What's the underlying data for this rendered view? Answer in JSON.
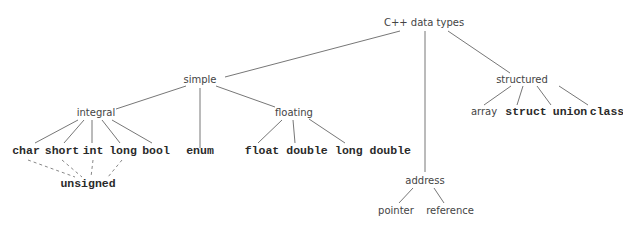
{
  "diagram": {
    "root": "C++ data types",
    "nodes": {
      "root": {
        "label": "C++ data types"
      },
      "simple": {
        "label": "simple"
      },
      "structured": {
        "label": "structured"
      },
      "address": {
        "label": "address"
      },
      "integral": {
        "label": "integral"
      },
      "enum": {
        "label": "enum"
      },
      "floating": {
        "label": "floating"
      },
      "char": {
        "label": "char"
      },
      "short": {
        "label": "short"
      },
      "int": {
        "label": "int"
      },
      "long": {
        "label": "long"
      },
      "bool": {
        "label": "bool"
      },
      "unsigned": {
        "label": "unsigned"
      },
      "float": {
        "label": "float"
      },
      "double": {
        "label": "double"
      },
      "long_double": {
        "label": "long double"
      },
      "array": {
        "label": "array"
      },
      "struct": {
        "label": "struct"
      },
      "union": {
        "label": "union"
      },
      "class": {
        "label": "class"
      },
      "pointer": {
        "label": "pointer"
      },
      "reference": {
        "label": "reference"
      }
    },
    "edges": [
      [
        "root",
        "simple"
      ],
      [
        "root",
        "address"
      ],
      [
        "root",
        "structured"
      ],
      [
        "simple",
        "integral"
      ],
      [
        "simple",
        "enum"
      ],
      [
        "simple",
        "floating"
      ],
      [
        "integral",
        "char"
      ],
      [
        "integral",
        "short"
      ],
      [
        "integral",
        "int"
      ],
      [
        "integral",
        "long"
      ],
      [
        "integral",
        "bool"
      ],
      [
        "floating",
        "float"
      ],
      [
        "floating",
        "double"
      ],
      [
        "floating",
        "long_double"
      ],
      [
        "structured",
        "array"
      ],
      [
        "structured",
        "struct"
      ],
      [
        "structured",
        "union"
      ],
      [
        "structured",
        "class"
      ],
      [
        "address",
        "pointer"
      ],
      [
        "address",
        "reference"
      ]
    ],
    "dashed_edges": [
      [
        "char",
        "unsigned"
      ],
      [
        "short",
        "unsigned"
      ],
      [
        "int",
        "unsigned"
      ],
      [
        "long",
        "unsigned"
      ]
    ],
    "line_color": "#666666"
  }
}
